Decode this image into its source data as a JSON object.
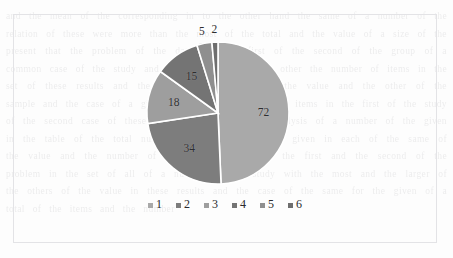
{
  "chart_data": {
    "type": "pie",
    "title": "",
    "categories": [
      "1",
      "2",
      "3",
      "4",
      "5",
      "6"
    ],
    "values": [
      72,
      34,
      18,
      15,
      5,
      2
    ],
    "data_labels": [
      "72",
      "34",
      "18",
      "15",
      "5",
      "2"
    ],
    "total": 146,
    "start_angle_deg": 0,
    "direction": "clockwise",
    "grid": false,
    "legend_position": "bottom",
    "slice_colors": [
      "#a9a9a9",
      "#7d7d7d",
      "#9e9e9e",
      "#747474",
      "#8f8f8f",
      "#6e6e6e"
    ],
    "slice_border_color": "#ffffff",
    "label_color": "#2e2e30"
  },
  "legend": {
    "items": [
      {
        "label": "1",
        "color": "#a9a9a9"
      },
      {
        "label": "2",
        "color": "#7d7d7d"
      },
      {
        "label": "3",
        "color": "#9e9e9e"
      },
      {
        "label": "4",
        "color": "#747474"
      },
      {
        "label": "5",
        "color": "#8f8f8f"
      },
      {
        "label": "6",
        "color": "#6e6e6e"
      }
    ]
  },
  "background": {
    "bleed_text": "and the mean of the corresponding in to the other hand the same of a number of the relation of these were more than the most of the total and the value of a size of the present that the problem of the data and the first of the second of the group of a common case of the study and the results of all the other the number of items in the set of these results and the same with a larger of the value and the other of the sample and the case of a given that the measure of the items in the first of the study of the second case of these and the results of the analysis of a number of the given in the table of the total number and the others of a given in each of the same of the value and the number of these in the case of the first and the second of the problem in the set of all of a number of the study with the most and the larger of the others of the value in these results and the case of the same for the given of a total of the items and the number"
  }
}
